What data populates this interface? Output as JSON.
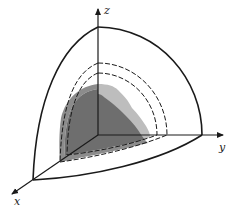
{
  "figure": {
    "type": "3d-octant-diagram",
    "axes": {
      "x_label": "x",
      "y_label": "y",
      "z_label": "z"
    },
    "surfaces": [
      {
        "name": "outer-shell",
        "style": "solid"
      },
      {
        "name": "middle-shell",
        "style": "dashed"
      },
      {
        "name": "inner-shell",
        "style": "dashed"
      }
    ],
    "shaded_regions": [
      {
        "name": "light-region",
        "color": "#bdbdbd"
      },
      {
        "name": "medium-region",
        "color": "#8c8c8c"
      },
      {
        "name": "dark-region",
        "color": "#6e6e6e"
      }
    ],
    "colors": {
      "line": "#1a1a1a",
      "background": "#ffffff"
    }
  }
}
